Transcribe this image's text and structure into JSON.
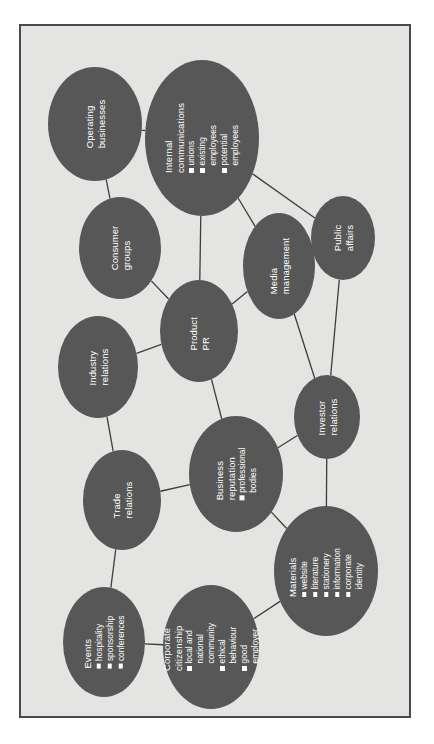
{
  "figure": {
    "type": "node-link-diagram",
    "background_color": "#e4e4e2",
    "node_color": "#575757",
    "node_text_color": "#ffffff",
    "edge_color": "#3d3d3d",
    "border_color": "#4a4a4a",
    "text_orientation": "rotated-90-ccw"
  },
  "nodes": [
    {
      "id": "operating-businesses",
      "title": "Operating\nbusinesses",
      "bullets": [],
      "cx": 74,
      "cy": 98,
      "rx": 47,
      "ry": 57
    },
    {
      "id": "internal-communications",
      "title": "Internal communications",
      "bullets": [
        "unions",
        "existing employees",
        "potential employees"
      ],
      "cx": 181,
      "cy": 112,
      "rx": 57,
      "ry": 78
    },
    {
      "id": "consumer-groups",
      "title": "Consumer\ngroups",
      "bullets": [],
      "cx": 99,
      "cy": 222,
      "rx": 41,
      "ry": 51
    },
    {
      "id": "media-management",
      "title": "Media\nmanagement",
      "bullets": [],
      "cx": 258,
      "cy": 240,
      "rx": 36,
      "ry": 53
    },
    {
      "id": "public-affairs",
      "title": "Public\naffairs",
      "bullets": [],
      "cx": 322,
      "cy": 212,
      "rx": 32,
      "ry": 42
    },
    {
      "id": "product-pr",
      "title": "Product PR",
      "bullets": [],
      "cx": 178,
      "cy": 305,
      "rx": 39,
      "ry": 51
    },
    {
      "id": "industry-relations",
      "title": "Industry\nrelations",
      "bullets": [],
      "cx": 77,
      "cy": 341,
      "rx": 40,
      "ry": 51
    },
    {
      "id": "investor-relations",
      "title": "Investor\nrelations",
      "bullets": [],
      "cx": 306,
      "cy": 391,
      "rx": 33,
      "ry": 42
    },
    {
      "id": "business-reputation",
      "title": "Business\nreputation",
      "bullets": [
        "professional bodies"
      ],
      "cx": 215,
      "cy": 448,
      "rx": 47,
      "ry": 58
    },
    {
      "id": "trade-relations",
      "title": "Trade\nrelations",
      "bullets": [],
      "cx": 101,
      "cy": 474,
      "rx": 39,
      "ry": 50
    },
    {
      "id": "materials",
      "title": "Materials",
      "bullets": [
        "website",
        "literature",
        "stationery",
        "information",
        "corporate identity"
      ],
      "cx": 305,
      "cy": 545,
      "rx": 52,
      "ry": 65
    },
    {
      "id": "corporate-citizenship",
      "title": "Corporate citizenship",
      "bullets": [
        "local and national\ncommunity",
        "ethical behaviour",
        "good employer"
      ],
      "cx": 190,
      "cy": 621,
      "rx": 48,
      "ry": 62
    },
    {
      "id": "events",
      "title": "Events",
      "bullets": [
        "hospitality",
        "sponsorship",
        "conferences"
      ],
      "cx": 83,
      "cy": 616,
      "rx": 41,
      "ry": 55
    }
  ],
  "edges": [
    {
      "from": "operating-businesses",
      "to": "internal-communications"
    },
    {
      "from": "operating-businesses",
      "to": "consumer-groups"
    },
    {
      "from": "internal-communications",
      "to": "public-affairs"
    },
    {
      "from": "internal-communications",
      "to": "media-management"
    },
    {
      "from": "internal-communications",
      "to": "product-pr"
    },
    {
      "from": "consumer-groups",
      "to": "product-pr"
    },
    {
      "from": "media-management",
      "to": "public-affairs"
    },
    {
      "from": "media-management",
      "to": "product-pr"
    },
    {
      "from": "media-management",
      "to": "investor-relations"
    },
    {
      "from": "public-affairs",
      "to": "investor-relations"
    },
    {
      "from": "product-pr",
      "to": "industry-relations"
    },
    {
      "from": "product-pr",
      "to": "business-reputation"
    },
    {
      "from": "industry-relations",
      "to": "trade-relations"
    },
    {
      "from": "business-reputation",
      "to": "trade-relations"
    },
    {
      "from": "business-reputation",
      "to": "investor-relations"
    },
    {
      "from": "business-reputation",
      "to": "materials"
    },
    {
      "from": "investor-relations",
      "to": "materials"
    },
    {
      "from": "trade-relations",
      "to": "events"
    },
    {
      "from": "events",
      "to": "corporate-citizenship"
    },
    {
      "from": "corporate-citizenship",
      "to": "materials"
    }
  ]
}
